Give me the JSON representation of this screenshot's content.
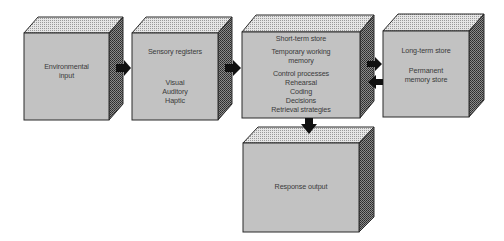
{
  "diagram": {
    "colors": {
      "front": "#c2c2c2",
      "outline": "#2a2a2a",
      "arrow": "#111111",
      "text": "#3a3a3a"
    },
    "boxes": [
      {
        "id": "environmental-input",
        "lines": [
          "Environmental",
          "input"
        ]
      },
      {
        "id": "sensory-registers",
        "heading": "Sensory registers",
        "lines": [
          "Visual",
          "Auditory",
          "Haptic"
        ]
      },
      {
        "id": "short-term-store",
        "heading": "Short-term store",
        "sub": [
          "Temporary working",
          "memory"
        ],
        "lines": [
          "Control processes",
          "Rehearsal",
          "Coding",
          "Decisions",
          "Retrieval strategies"
        ]
      },
      {
        "id": "long-term-store",
        "heading": "Long-term store",
        "lines": [
          "Permanent",
          "memory store"
        ]
      },
      {
        "id": "response-output",
        "lines": [
          "Response output"
        ]
      }
    ],
    "arrows": [
      {
        "from": "environmental-input",
        "to": "sensory-registers",
        "direction": "right"
      },
      {
        "from": "sensory-registers",
        "to": "short-term-store",
        "direction": "right"
      },
      {
        "from": "short-term-store",
        "to": "long-term-store",
        "direction": "right"
      },
      {
        "from": "long-term-store",
        "to": "short-term-store",
        "direction": "left"
      },
      {
        "from": "short-term-store",
        "to": "response-output",
        "direction": "down"
      }
    ]
  }
}
